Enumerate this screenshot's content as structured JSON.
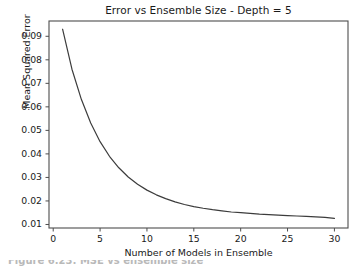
{
  "figure": {
    "background_color": "#ffffff",
    "axes_color": "#4d4d4d",
    "text_color": "#1a1a1a"
  },
  "caption": {
    "text": "Figure 6.23: MSE vs ensemble size",
    "visible": "partially-cropped"
  },
  "chart_data": {
    "type": "line",
    "title": "Error vs Ensemble Size - Depth = 5",
    "xlabel": "Number of Models in Ensemble",
    "ylabel": "Mean Squared Error",
    "xlim": [
      -0.45,
      31.45
    ],
    "ylim": [
      0.0085,
      0.0965
    ],
    "xticks": [
      0,
      5,
      10,
      15,
      20,
      25,
      30
    ],
    "xtick_labels": [
      "0",
      "5",
      "10",
      "15",
      "20",
      "25",
      "30"
    ],
    "yticks": [
      0.01,
      0.02,
      0.03,
      0.04,
      0.05,
      0.06,
      0.07,
      0.08,
      0.09
    ],
    "ytick_labels": [
      "0.01",
      "0.02",
      "0.03",
      "0.04",
      "0.05",
      "0.06",
      "0.07",
      "0.08",
      "0.09"
    ],
    "grid": false,
    "legend": false,
    "series": [
      {
        "name": "Mean Squared Error",
        "color": "#3c3c3c",
        "line_width": 1.2,
        "x": [
          1,
          2,
          3,
          4,
          5,
          6,
          7,
          8,
          9,
          10,
          11,
          12,
          13,
          14,
          15,
          16,
          17,
          18,
          19,
          20,
          21,
          22,
          23,
          24,
          25,
          26,
          27,
          28,
          29,
          30
        ],
        "values": [
          0.093,
          0.076,
          0.0632,
          0.0531,
          0.0452,
          0.039,
          0.0341,
          0.0302,
          0.0271,
          0.0246,
          0.0226,
          0.021,
          0.0196,
          0.0185,
          0.0176,
          0.0169,
          0.0163,
          0.0158,
          0.0153,
          0.015,
          0.0147,
          0.0144,
          0.0142,
          0.014,
          0.0138,
          0.0136,
          0.0134,
          0.0132,
          0.013,
          0.0126
        ]
      }
    ]
  }
}
